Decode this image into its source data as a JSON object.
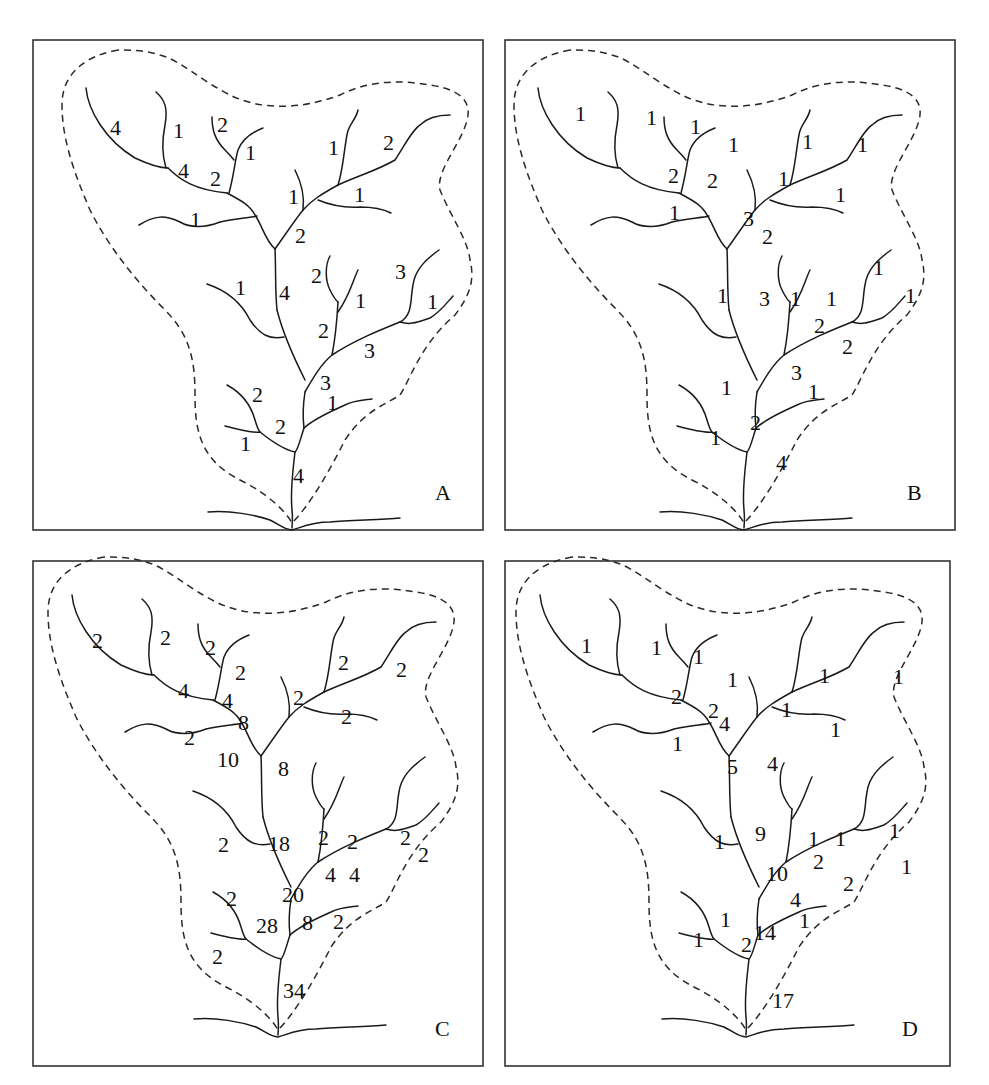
{
  "figure": {
    "panels": [
      {
        "id": "A",
        "letter": "A",
        "frame": {
          "x": 33,
          "y": 40,
          "w": 450,
          "h": 490
        },
        "offset": {
          "x": 0,
          "y": 0
        },
        "labels": [
          {
            "text": "4",
            "x": 110,
            "y": 135
          },
          {
            "text": "1",
            "x": 173,
            "y": 138
          },
          {
            "text": "2",
            "x": 217,
            "y": 132
          },
          {
            "text": "1",
            "x": 245,
            "y": 160
          },
          {
            "text": "4",
            "x": 178,
            "y": 178
          },
          {
            "text": "2",
            "x": 210,
            "y": 186
          },
          {
            "text": "1",
            "x": 328,
            "y": 155
          },
          {
            "text": "2",
            "x": 383,
            "y": 150
          },
          {
            "text": "1",
            "x": 288,
            "y": 204
          },
          {
            "text": "1",
            "x": 354,
            "y": 202
          },
          {
            "text": "1",
            "x": 190,
            "y": 227
          },
          {
            "text": "2",
            "x": 295,
            "y": 243
          },
          {
            "text": "1",
            "x": 235,
            "y": 295
          },
          {
            "text": "4",
            "x": 279,
            "y": 300
          },
          {
            "text": "2",
            "x": 311,
            "y": 283
          },
          {
            "text": "1",
            "x": 355,
            "y": 308
          },
          {
            "text": "3",
            "x": 395,
            "y": 279
          },
          {
            "text": "1",
            "x": 427,
            "y": 309
          },
          {
            "text": "2",
            "x": 318,
            "y": 338
          },
          {
            "text": "3",
            "x": 364,
            "y": 358
          },
          {
            "text": "3",
            "x": 320,
            "y": 390
          },
          {
            "text": "1",
            "x": 327,
            "y": 410
          },
          {
            "text": "2",
            "x": 252,
            "y": 402
          },
          {
            "text": "2",
            "x": 275,
            "y": 434
          },
          {
            "text": "1",
            "x": 240,
            "y": 451
          },
          {
            "text": "4",
            "x": 293,
            "y": 483
          }
        ]
      },
      {
        "id": "B",
        "letter": "B",
        "frame": {
          "x": 505,
          "y": 40,
          "w": 450,
          "h": 490
        },
        "offset": {
          "x": -20,
          "y": -2
        },
        "labels": [
          {
            "text": "1",
            "x": 575,
            "y": 121
          },
          {
            "text": "1",
            "x": 646,
            "y": 125
          },
          {
            "text": "1",
            "x": 690,
            "y": 134
          },
          {
            "text": "1",
            "x": 728,
            "y": 152
          },
          {
            "text": "2",
            "x": 668,
            "y": 183
          },
          {
            "text": "2",
            "x": 707,
            "y": 188
          },
          {
            "text": "1",
            "x": 802,
            "y": 149
          },
          {
            "text": "1",
            "x": 857,
            "y": 152
          },
          {
            "text": "1",
            "x": 778,
            "y": 186
          },
          {
            "text": "1",
            "x": 835,
            "y": 202
          },
          {
            "text": "1",
            "x": 669,
            "y": 220
          },
          {
            "text": "3",
            "x": 743,
            "y": 226
          },
          {
            "text": "2",
            "x": 762,
            "y": 244
          },
          {
            "text": "1",
            "x": 717,
            "y": 303
          },
          {
            "text": "3",
            "x": 759,
            "y": 306
          },
          {
            "text": "1",
            "x": 790,
            "y": 306
          },
          {
            "text": "1",
            "x": 826,
            "y": 306
          },
          {
            "text": "1",
            "x": 873,
            "y": 275
          },
          {
            "text": "1",
            "x": 905,
            "y": 303
          },
          {
            "text": "2",
            "x": 814,
            "y": 333
          },
          {
            "text": "2",
            "x": 842,
            "y": 354
          },
          {
            "text": "3",
            "x": 791,
            "y": 380
          },
          {
            "text": "1",
            "x": 808,
            "y": 399
          },
          {
            "text": "1",
            "x": 721,
            "y": 395
          },
          {
            "text": "2",
            "x": 750,
            "y": 430
          },
          {
            "text": "1",
            "x": 710,
            "y": 445
          },
          {
            "text": "4",
            "x": 776,
            "y": 470
          }
        ]
      },
      {
        "id": "C",
        "letter": "C",
        "frame": {
          "x": 33,
          "y": 561,
          "w": 450,
          "h": 505
        },
        "offset": {
          "x": -14,
          "y": 525
        },
        "labels": [
          {
            "text": "2",
            "x": 92,
            "y": 648
          },
          {
            "text": "2",
            "x": 160,
            "y": 645
          },
          {
            "text": "2",
            "x": 205,
            "y": 655
          },
          {
            "text": "2",
            "x": 235,
            "y": 680
          },
          {
            "text": "4",
            "x": 178,
            "y": 698
          },
          {
            "text": "4",
            "x": 222,
            "y": 708
          },
          {
            "text": "8",
            "x": 238,
            "y": 730
          },
          {
            "text": "2",
            "x": 338,
            "y": 670
          },
          {
            "text": "2",
            "x": 396,
            "y": 677
          },
          {
            "text": "2",
            "x": 293,
            "y": 705
          },
          {
            "text": "2",
            "x": 341,
            "y": 724
          },
          {
            "text": "2",
            "x": 184,
            "y": 745
          },
          {
            "text": "10",
            "x": 217,
            "y": 767
          },
          {
            "text": "8",
            "x": 278,
            "y": 776
          },
          {
            "text": "2",
            "x": 218,
            "y": 852
          },
          {
            "text": "18",
            "x": 268,
            "y": 851
          },
          {
            "text": "2",
            "x": 318,
            "y": 845
          },
          {
            "text": "2",
            "x": 347,
            "y": 849
          },
          {
            "text": "4",
            "x": 325,
            "y": 882
          },
          {
            "text": "4",
            "x": 349,
            "y": 882
          },
          {
            "text": "2",
            "x": 400,
            "y": 845
          },
          {
            "text": "2",
            "x": 418,
            "y": 862
          },
          {
            "text": "20",
            "x": 282,
            "y": 902
          },
          {
            "text": "2",
            "x": 226,
            "y": 906
          },
          {
            "text": "28",
            "x": 256,
            "y": 933
          },
          {
            "text": "8",
            "x": 302,
            "y": 930
          },
          {
            "text": "2",
            "x": 333,
            "y": 929
          },
          {
            "text": "2",
            "x": 212,
            "y": 964
          },
          {
            "text": "34",
            "x": 283,
            "y": 998
          }
        ]
      },
      {
        "id": "D",
        "letter": "D",
        "frame": {
          "x": 505,
          "y": 561,
          "w": 445,
          "h": 505
        },
        "offset": {
          "x": -18,
          "y": 527
        },
        "labels": [
          {
            "text": "1",
            "x": 581,
            "y": 653
          },
          {
            "text": "1",
            "x": 651,
            "y": 655
          },
          {
            "text": "1",
            "x": 693,
            "y": 664
          },
          {
            "text": "1",
            "x": 727,
            "y": 687
          },
          {
            "text": "2",
            "x": 671,
            "y": 704
          },
          {
            "text": "2",
            "x": 708,
            "y": 718
          },
          {
            "text": "4",
            "x": 719,
            "y": 731
          },
          {
            "text": "1",
            "x": 819,
            "y": 683
          },
          {
            "text": "1",
            "x": 893,
            "y": 684
          },
          {
            "text": "1",
            "x": 781,
            "y": 717
          },
          {
            "text": "1",
            "x": 830,
            "y": 737
          },
          {
            "text": "1",
            "x": 672,
            "y": 751
          },
          {
            "text": "5",
            "x": 727,
            "y": 774
          },
          {
            "text": "4",
            "x": 767,
            "y": 771
          },
          {
            "text": "1",
            "x": 714,
            "y": 849
          },
          {
            "text": "9",
            "x": 755,
            "y": 841
          },
          {
            "text": "1",
            "x": 808,
            "y": 846
          },
          {
            "text": "1",
            "x": 835,
            "y": 846
          },
          {
            "text": "1",
            "x": 889,
            "y": 838
          },
          {
            "text": "2",
            "x": 813,
            "y": 869
          },
          {
            "text": "1",
            "x": 901,
            "y": 874
          },
          {
            "text": "10",
            "x": 766,
            "y": 881
          },
          {
            "text": "2",
            "x": 843,
            "y": 891
          },
          {
            "text": "4",
            "x": 790,
            "y": 907
          },
          {
            "text": "1",
            "x": 799,
            "y": 928
          },
          {
            "text": "1",
            "x": 720,
            "y": 927
          },
          {
            "text": "14",
            "x": 754,
            "y": 940
          },
          {
            "text": "1",
            "x": 693,
            "y": 947
          },
          {
            "text": "2",
            "x": 741,
            "y": 952
          },
          {
            "text": "17",
            "x": 772,
            "y": 1008
          }
        ]
      }
    ],
    "geometry": {
      "boundary": "M 118,50 C 90,55 62,70 62,105 C 62,140 75,175 90,210 C 110,250 140,285 165,310 C 190,335 195,360 195,395 C 195,430 200,460 240,480 C 265,492 285,510 292,523 C 310,505 330,470 345,440 C 365,410 385,405 400,395 C 410,380 420,345 455,315 C 470,295 475,280 470,260 C 468,240 450,215 440,190 C 435,170 465,140 468,115 C 470,95 450,88 430,85 C 400,80 370,80 340,95 C 300,110 260,110 230,95 C 200,80 180,60 160,55 C 145,50 130,50 118,50",
      "streams": [
        "M 86,88 C 88,110 105,140 135,158 C 150,165 160,168 168,168",
        "M 156,92 C 165,100 168,108 165,125 C 162,140 162,155 166,168",
        "M 168,168 C 180,180 195,190 227,193",
        "M 212,117 C 212,130 215,140 225,150 C 230,155 234,160 234,160",
        "M 263,128 C 250,133 242,140 238,150 C 235,160 234,175 229,193",
        "M 227,193 C 240,200 250,205 255,215 C 262,225 265,240 275,249",
        "M 139,225 C 155,215 165,215 180,222 C 190,228 205,228 220,222 C 235,218 250,218 257,216",
        "M 275,249 C 285,235 295,220 303,210",
        "M 295,170 C 300,180 305,195 303,210",
        "M 303,210 C 312,200 320,195 338,185",
        "M 318,200 C 330,205 345,208 360,207 C 375,207 385,210 391,213",
        "M 358,110 C 356,120 348,125 347,135 C 344,150 343,170 338,185",
        "M 338,185 C 360,175 378,170 395,160 C 405,145 412,130 420,125 C 425,120 435,115 450,115",
        "M 275,249 C 276,270 275,290 277,310",
        "M 207,284 C 225,290 240,300 250,320 C 260,335 270,340 284,337",
        "M 277,310 C 282,330 290,350 305,380",
        "M 330,256 C 325,265 325,280 330,290 C 335,300 338,302 338,302",
        "M 358,270 C 353,280 350,295 338,312",
        "M 338,302 C 337,320 335,340 332,355",
        "M 439,250 C 425,260 415,270 413,285 C 410,300 413,315 400,322",
        "M 453,296 C 445,305 440,312 430,318 C 415,323 410,325 400,322",
        "M 400,322 C 380,330 355,340 332,355 C 320,365 312,380 305,392",
        "M 305,392 C 303,405 303,420 304,428",
        "M 304,428 C 315,418 330,412 345,405 C 355,400 365,400 372,399",
        "M 227,385 C 240,392 250,402 255,420 C 258,430 260,432 260,432",
        "M 225,426 C 240,430 255,433 260,432 C 270,440 285,450 295,452",
        "M 304,428 C 300,440 298,450 295,452 C 293,470 290,490 292,510 C 293,520 292,525 292,528",
        "M 208,512 C 230,510 255,515 270,520 C 280,525 285,530 292,530 C 300,528 310,522 330,522 C 350,520 380,520 400,518"
      ]
    }
  }
}
